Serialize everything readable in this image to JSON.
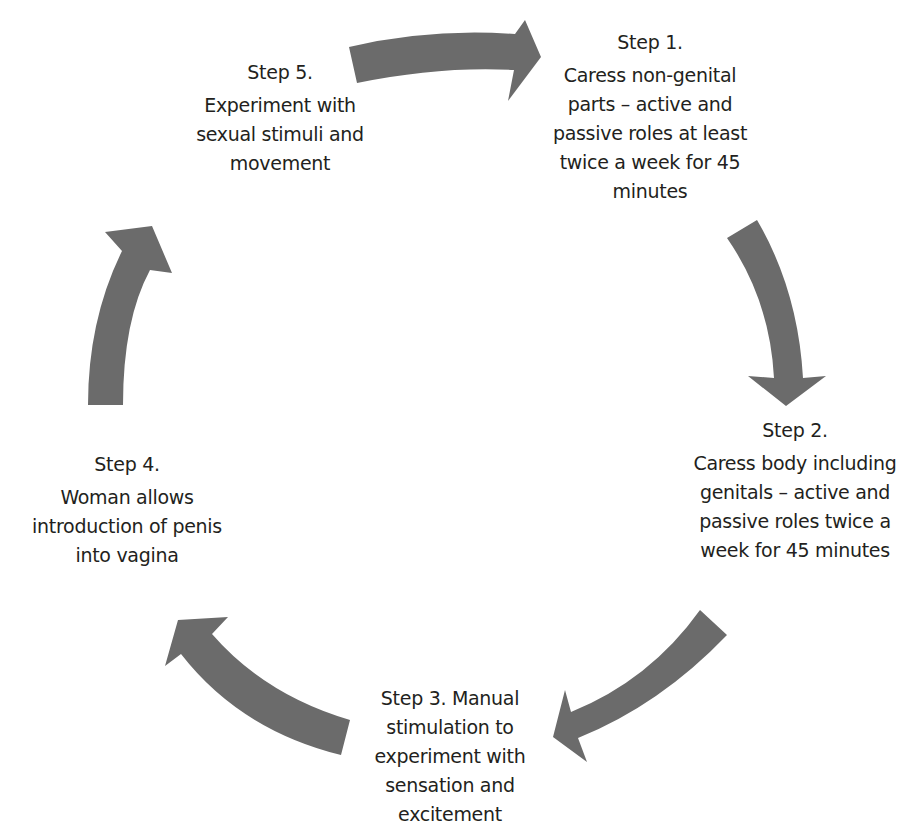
{
  "diagram": {
    "type": "cycle",
    "arrow_color": "#6b6b6b",
    "steps": [
      {
        "title": "Step 1.",
        "body": "Caress non-genital parts – active and passive roles at least twice a week for 45 minutes"
      },
      {
        "title": "Step 2.",
        "body": "Caress body including genitals – active and passive roles twice a week for 45 minutes"
      },
      {
        "title": "Step 3. Manual stimulation to experiment with sensation and excitement"
      },
      {
        "title": "Step 4.",
        "body": "Woman allows introduction of penis into vagina"
      },
      {
        "title": "Step 5.",
        "body": "Experiment with sexual stimuli and movement"
      }
    ],
    "arrows": [
      {
        "from": "Step 5",
        "to": "Step 1",
        "icon": "curved-arrow-right"
      },
      {
        "from": "Step 1",
        "to": "Step 2",
        "icon": "curved-arrow-down"
      },
      {
        "from": "Step 2",
        "to": "Step 3",
        "icon": "curved-arrow-down-left"
      },
      {
        "from": "Step 3",
        "to": "Step 4",
        "icon": "curved-arrow-up-left"
      },
      {
        "from": "Step 4",
        "to": "Step 5",
        "icon": "curved-arrow-up"
      }
    ]
  }
}
